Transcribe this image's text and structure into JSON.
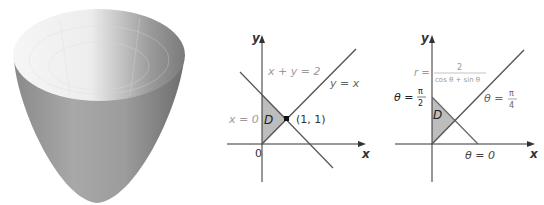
{
  "figure": {
    "surface": {
      "label": "paraboloid-surface"
    },
    "cartesian": {
      "y_axis_label": "y",
      "x_axis_label": "x",
      "origin_label": "0",
      "line1_label": "x + y = 2",
      "line2_label": "y = x",
      "line3_label": "x = 0",
      "region_label": "D",
      "point_label": "(1, 1)"
    },
    "polar": {
      "y_axis_label": "y",
      "x_axis_label": "x",
      "r_label": "r =",
      "r_numerator": "2",
      "r_denominator": "cos θ + sin θ",
      "theta_half_pi_label": "θ =",
      "half_pi_num": "π",
      "half_pi_den": "2",
      "theta_quarter_pi_label": "θ =",
      "quarter_pi_num": "π",
      "quarter_pi_den": "4",
      "theta_zero_label": "θ = 0",
      "region_label": "D"
    },
    "colors": {
      "axis": "#333333",
      "line": "#666666",
      "region": "#bdbdbd",
      "faint_label": "#9a9a9a"
    }
  }
}
